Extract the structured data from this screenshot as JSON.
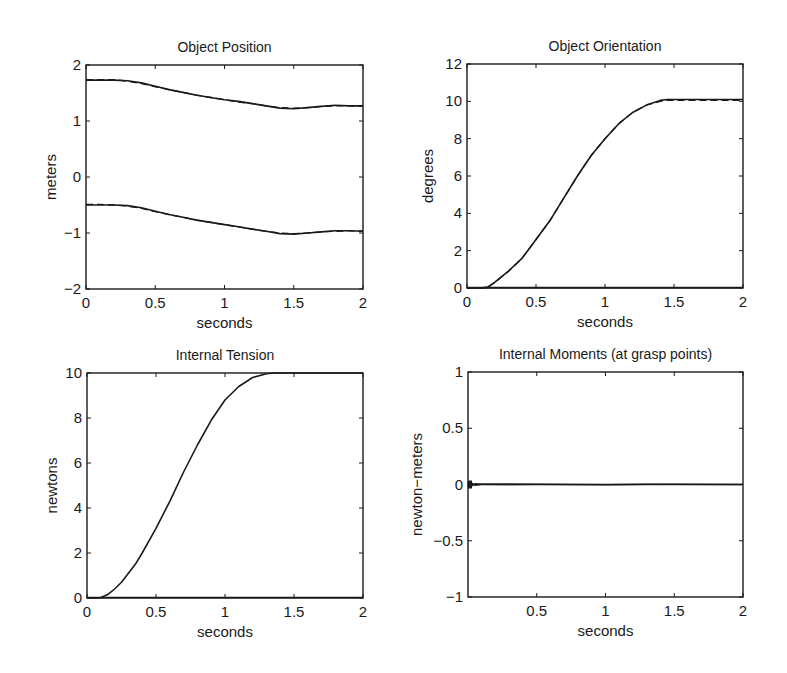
{
  "figure": {
    "background": "#ffffff",
    "ink_color": "#1a1a1a"
  },
  "chart_data": [
    {
      "type": "line",
      "title": "Object Position",
      "xlabel": "seconds",
      "ylabel": "meters",
      "xlim": [
        0,
        2
      ],
      "ylim": [
        -2,
        2
      ],
      "xticks": [
        0,
        0.5,
        1,
        1.5,
        2
      ],
      "xtick_labels": [
        "0",
        "0.5",
        "1",
        "1.5",
        "2"
      ],
      "yticks": [
        -2,
        -1,
        0,
        1,
        2
      ],
      "ytick_labels": [
        "-2",
        "-1",
        "0",
        "1",
        "2"
      ],
      "grid": false,
      "box": {
        "left": 86,
        "top": 65,
        "right": 363,
        "bottom": 289
      },
      "series": [
        {
          "name": "x actual",
          "style": "solid",
          "x": [
            0,
            0.1,
            0.2,
            0.3,
            0.4,
            0.5,
            0.6,
            0.7,
            0.8,
            0.9,
            1.0,
            1.1,
            1.2,
            1.3,
            1.4,
            1.5,
            1.6,
            1.7,
            1.8,
            1.9,
            2.0
          ],
          "y": [
            1.73,
            1.73,
            1.73,
            1.72,
            1.68,
            1.62,
            1.56,
            1.51,
            1.46,
            1.42,
            1.38,
            1.35,
            1.31,
            1.27,
            1.23,
            1.22,
            1.24,
            1.26,
            1.28,
            1.27,
            1.27
          ]
        },
        {
          "name": "x desired",
          "style": "dashed",
          "x": [
            0,
            0.1,
            0.2,
            0.3,
            0.4,
            0.5,
            0.6,
            0.7,
            0.8,
            0.9,
            1.0,
            1.1,
            1.2,
            1.3,
            1.4,
            1.5,
            1.6,
            1.7,
            1.8,
            1.9,
            2.0
          ],
          "y": [
            1.74,
            1.74,
            1.74,
            1.71,
            1.67,
            1.61,
            1.56,
            1.51,
            1.46,
            1.42,
            1.38,
            1.34,
            1.31,
            1.27,
            1.24,
            1.23,
            1.24,
            1.26,
            1.27,
            1.27,
            1.26
          ]
        },
        {
          "name": "y actual",
          "style": "solid",
          "x": [
            0,
            0.1,
            0.2,
            0.3,
            0.4,
            0.5,
            0.6,
            0.7,
            0.8,
            0.9,
            1.0,
            1.1,
            1.2,
            1.3,
            1.4,
            1.5,
            1.6,
            1.7,
            1.8,
            1.9,
            2.0
          ],
          "y": [
            -0.5,
            -0.5,
            -0.5,
            -0.51,
            -0.55,
            -0.61,
            -0.67,
            -0.72,
            -0.77,
            -0.81,
            -0.85,
            -0.89,
            -0.93,
            -0.97,
            -1.01,
            -1.02,
            -1.0,
            -0.98,
            -0.96,
            -0.96,
            -0.97
          ]
        },
        {
          "name": "y desired",
          "style": "dashed",
          "x": [
            0,
            0.1,
            0.2,
            0.3,
            0.4,
            0.5,
            0.6,
            0.7,
            0.8,
            0.9,
            1.0,
            1.1,
            1.2,
            1.3,
            1.4,
            1.5,
            1.6,
            1.7,
            1.8,
            1.9,
            2.0
          ],
          "y": [
            -0.49,
            -0.49,
            -0.5,
            -0.52,
            -0.56,
            -0.62,
            -0.67,
            -0.72,
            -0.77,
            -0.81,
            -0.85,
            -0.89,
            -0.93,
            -0.97,
            -1.0,
            -1.01,
            -1.0,
            -0.98,
            -0.97,
            -0.96,
            -0.96
          ]
        }
      ]
    },
    {
      "type": "line",
      "title": "Object Orientation",
      "xlabel": "seconds",
      "ylabel": "degrees",
      "xlim": [
        0,
        2
      ],
      "ylim": [
        0,
        12
      ],
      "xticks": [
        0,
        0.5,
        1,
        1.5,
        2
      ],
      "xtick_labels": [
        "0",
        "0.5",
        "1",
        "1.5",
        "2"
      ],
      "yticks": [
        0,
        2,
        4,
        6,
        8,
        10,
        12
      ],
      "ytick_labels": [
        "0",
        "2",
        "4",
        "6",
        "8",
        "10",
        "12"
      ],
      "grid": false,
      "box": {
        "left": 467,
        "top": 64,
        "right": 743,
        "bottom": 288
      },
      "series": [
        {
          "name": "orientation actual",
          "style": "solid",
          "x": [
            0,
            0.1,
            0.15,
            0.2,
            0.3,
            0.4,
            0.5,
            0.6,
            0.7,
            0.8,
            0.9,
            1.0,
            1.1,
            1.2,
            1.3,
            1.4,
            1.45,
            1.5,
            1.6,
            1.8,
            2.0
          ],
          "y": [
            0,
            0,
            0.05,
            0.3,
            0.9,
            1.6,
            2.6,
            3.6,
            4.8,
            6.0,
            7.1,
            8.0,
            8.8,
            9.4,
            9.8,
            10.05,
            10.1,
            10.1,
            10.1,
            10.1,
            10.1
          ]
        },
        {
          "name": "orientation desired",
          "style": "dashed",
          "x": [
            0,
            0.1,
            0.15,
            0.2,
            0.3,
            0.4,
            0.5,
            0.6,
            0.7,
            0.8,
            0.9,
            1.0,
            1.1,
            1.2,
            1.3,
            1.4,
            1.45,
            1.5,
            1.6,
            1.8,
            2.0
          ],
          "y": [
            0,
            0,
            0.04,
            0.28,
            0.88,
            1.6,
            2.6,
            3.6,
            4.8,
            6.0,
            7.1,
            8.0,
            8.8,
            9.4,
            9.8,
            10.0,
            10.05,
            10.05,
            10.05,
            10.05,
            10.05
          ]
        },
        {
          "name": "zero baseline",
          "style": "solid",
          "x": [
            0,
            2
          ],
          "y": [
            0.02,
            0.02
          ]
        }
      ]
    },
    {
      "type": "line",
      "title": "Internal Tension",
      "xlabel": "seconds",
      "ylabel": "newtons",
      "xlim": [
        0,
        2
      ],
      "ylim": [
        0,
        10
      ],
      "xticks": [
        0,
        0.5,
        1,
        1.5,
        2
      ],
      "xtick_labels": [
        "0",
        "0.5",
        "1",
        "1.5",
        "2"
      ],
      "yticks": [
        0,
        2,
        4,
        6,
        8,
        10
      ],
      "ytick_labels": [
        "0",
        "2",
        "4",
        "6",
        "8",
        "10"
      ],
      "grid": false,
      "box": {
        "left": 87,
        "top": 373,
        "right": 363,
        "bottom": 598
      },
      "series": [
        {
          "name": "tension",
          "style": "solid",
          "x": [
            0,
            0.05,
            0.1,
            0.15,
            0.2,
            0.25,
            0.3,
            0.35,
            0.4,
            0.5,
            0.6,
            0.7,
            0.8,
            0.9,
            1.0,
            1.1,
            1.2,
            1.3,
            1.35,
            1.4,
            1.45,
            1.5,
            1.7,
            2.0
          ],
          "y": [
            0,
            0,
            0.02,
            0.15,
            0.4,
            0.7,
            1.1,
            1.5,
            2.0,
            3.1,
            4.3,
            5.6,
            6.8,
            7.9,
            8.8,
            9.4,
            9.8,
            9.97,
            10.0,
            10.0,
            10.0,
            10.0,
            10.0,
            10.0
          ]
        },
        {
          "name": "zero baseline",
          "style": "solid",
          "x": [
            0,
            2
          ],
          "y": [
            0.02,
            0.02
          ]
        }
      ]
    },
    {
      "type": "line",
      "title": "Internal Moments (at grasp points)",
      "xlabel": "seconds",
      "ylabel": "newton−meters",
      "xlim": [
        0,
        2
      ],
      "ylim": [
        -1,
        1
      ],
      "xticks": [
        0.5,
        1,
        1.5,
        2
      ],
      "xtick_labels": [
        "0.5",
        "1",
        "1.5",
        "2"
      ],
      "yticks": [
        -1,
        -0.5,
        0,
        0.5,
        1
      ],
      "ytick_labels": [
        "-1",
        "-0.5",
        "0",
        "0.5",
        "1"
      ],
      "grid": false,
      "box": {
        "left": 468,
        "top": 372,
        "right": 743,
        "bottom": 597
      },
      "series": [
        {
          "name": "moment 1",
          "style": "solid",
          "x": [
            0,
            0.01,
            0.02,
            0.03,
            0.05,
            0.1,
            0.5,
            1.0,
            1.3,
            1.5,
            2.0
          ],
          "y": [
            0.02,
            -0.02,
            0.015,
            -0.01,
            0.005,
            0.002,
            0.0,
            0.0,
            0.003,
            0.0,
            0.0
          ]
        },
        {
          "name": "moment 2",
          "style": "solid",
          "x": [
            0,
            0.01,
            0.02,
            0.03,
            0.05,
            0.1,
            0.5,
            1.0,
            1.3,
            1.5,
            2.0
          ],
          "y": [
            -0.02,
            0.02,
            -0.015,
            0.01,
            -0.005,
            0.001,
            0.002,
            -0.002,
            0.0,
            0.002,
            0.0
          ]
        }
      ]
    }
  ]
}
